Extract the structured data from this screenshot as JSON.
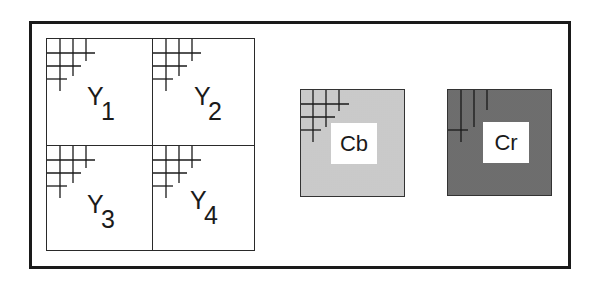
{
  "diagram": {
    "title": "",
    "luma_blocks": [
      {
        "id": "Y1",
        "letter": "Y",
        "subscript": "1",
        "position": "top-left"
      },
      {
        "id": "Y2",
        "letter": "Y",
        "subscript": "2",
        "position": "top-right"
      },
      {
        "id": "Y3",
        "letter": "Y",
        "subscript": "3",
        "position": "bottom-left"
      },
      {
        "id": "Y4",
        "letter": "Y",
        "subscript": "4",
        "position": "bottom-right"
      }
    ],
    "chroma_blocks": [
      {
        "id": "Cb",
        "label": "Cb",
        "fill": "#d4d4d4"
      },
      {
        "id": "Cr",
        "label": "Cr",
        "fill": "#7a7a7a"
      }
    ],
    "colors": {
      "frame": "#1a1a1a",
      "line": "#2a2a2a",
      "background": "#ffffff"
    }
  }
}
